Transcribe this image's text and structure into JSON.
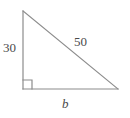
{
  "figure": {
    "type": "right-triangle-diagram",
    "stroke_color": "#8c8c8c",
    "label_color": "#4a4a4a",
    "background_color": "#ffffff",
    "vertices": {
      "apex": [
        23,
        11
      ],
      "right_angle": [
        23,
        89
      ],
      "base_right": [
        118,
        89
      ]
    },
    "right_angle_marker": {
      "present": true,
      "at": "right_angle",
      "size": 9
    },
    "labels": {
      "vertical_leg": "30",
      "hypotenuse": "50",
      "base": "b"
    }
  }
}
